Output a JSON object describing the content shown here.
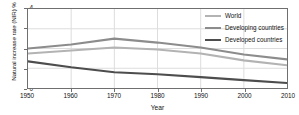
{
  "chart_data": {
    "type": "line",
    "title": "",
    "xlabel": "Year",
    "ylabel": "Natural increase rate (NIR) %",
    "xlim": [
      1950,
      2010
    ],
    "ylim": [
      0,
      4
    ],
    "xticks": [
      1950,
      1960,
      1970,
      1980,
      1990,
      2000,
      2010
    ],
    "yticks": [
      0,
      1,
      2,
      3,
      4
    ],
    "grid": true,
    "legend_position": "top-right",
    "x": [
      1950,
      1960,
      1970,
      1980,
      1990,
      2000,
      2010
    ],
    "series": [
      {
        "name": "World",
        "color": "#b3b3b3",
        "values": [
          1.75,
          1.9,
          2.05,
          1.95,
          1.75,
          1.4,
          1.15
        ]
      },
      {
        "name": "Developing countries",
        "color": "#8c8c8c",
        "values": [
          2.0,
          2.2,
          2.5,
          2.3,
          2.05,
          1.7,
          1.45
        ]
      },
      {
        "name": "Developed countries",
        "color": "#4d4d4d",
        "values": [
          1.35,
          1.05,
          0.8,
          0.7,
          0.55,
          0.4,
          0.25
        ]
      }
    ]
  },
  "axes": {
    "ylabel": "Natural increase rate (NIR) %",
    "xlabel": "Year",
    "ytick_labels": [
      "0",
      "1",
      "2",
      "3",
      "4"
    ],
    "xtick_labels": [
      "1950",
      "1960",
      "1970",
      "1980",
      "1990",
      "2000",
      "2010"
    ]
  },
  "legend": {
    "items": [
      {
        "label": "World",
        "color": "#b3b3b3"
      },
      {
        "label": "Developing countries",
        "color": "#8c8c8c"
      },
      {
        "label": "Developed countries",
        "color": "#4d4d4d"
      }
    ]
  },
  "style": {
    "frame_color": "#6f6f6f",
    "grid_color": "#dcdcdc",
    "background": "#ffffff",
    "text_color": "#111111"
  }
}
